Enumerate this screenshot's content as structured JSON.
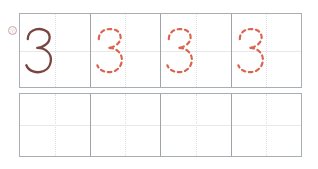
{
  "worksheet": {
    "title": "Handwriting practice worksheet",
    "character": "3",
    "marker": {
      "name": "row-marker",
      "label": "ⓘ"
    },
    "colors": {
      "outer_border": "#a9aeb3",
      "cell_divider": "#9ea3a8",
      "guide_line": "#dfe2e5",
      "trace_solid": "#7a4540",
      "trace_dashed": "#d9654f",
      "page_background": "#ffffff"
    },
    "rows": [
      {
        "name": "tracing-row",
        "index": 1,
        "filled": true,
        "cells": [
          {
            "index": 1,
            "character": "3",
            "style": "solid",
            "stroke": "#7a4540",
            "stroke_width": 3.2,
            "dash": "none"
          },
          {
            "index": 2,
            "character": "3",
            "style": "dashed",
            "stroke": "#d9654f",
            "stroke_width": 3.0,
            "dash": "5 5"
          },
          {
            "index": 3,
            "character": "3",
            "style": "dashed",
            "stroke": "#d9654f",
            "stroke_width": 3.0,
            "dash": "5 5"
          },
          {
            "index": 4,
            "character": "3",
            "style": "dashed",
            "stroke": "#d9654f",
            "stroke_width": 3.0,
            "dash": "5 5"
          }
        ]
      },
      {
        "name": "blank-practice-row",
        "index": 2,
        "filled": false,
        "cells": [
          {
            "index": 1,
            "character": "",
            "style": "empty"
          },
          {
            "index": 2,
            "character": "",
            "style": "empty"
          },
          {
            "index": 3,
            "character": "",
            "style": "empty"
          },
          {
            "index": 4,
            "character": "",
            "style": "empty"
          }
        ]
      }
    ],
    "glyph_path": "M 8 18 C 8 6, 20 2, 30 5 C 40 8, 41 20, 32 26 C 28 29, 24 30, 21 30 C 25 30, 31 31, 35 35 C 43 42, 41 57, 30 62 C 20 66, 9 62, 6 54"
  }
}
